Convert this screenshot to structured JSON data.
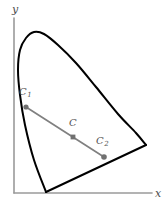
{
  "figure": {
    "background_color": "#ffffff"
  },
  "axes": {
    "x_label": "x",
    "y_label": "y",
    "axis_color": "#9a9a9a",
    "origin_px": [
      14,
      193
    ],
    "x_axis_end_px": [
      152,
      193
    ],
    "y_axis_end_px": [
      14,
      18
    ]
  },
  "labels": {
    "c1_main": "C",
    "c1_sub": "1",
    "c_main": "C",
    "c2_main": "C",
    "c2_sub": "2"
  },
  "chart_data": {
    "type": "line",
    "xlabel": "x",
    "ylabel": "y",
    "grid": false,
    "legend": null,
    "curve_color": "#000000",
    "segment_color": "#808080",
    "point_color": "#707070",
    "series": [
      {
        "name": "spectral-locus",
        "kind": "closed-boundary",
        "description": "Horseshoe-shaped spectral locus closed by straight purple line",
        "points_px": [
          [
            46,
            192
          ],
          [
            34,
            160
          ],
          [
            25,
            125
          ],
          [
            20,
            95
          ],
          [
            18,
            70
          ],
          [
            20,
            50
          ],
          [
            26,
            38
          ],
          [
            34,
            32
          ],
          [
            44,
            34
          ],
          [
            58,
            45
          ],
          [
            76,
            63
          ],
          [
            96,
            87
          ],
          [
            118,
            114
          ],
          [
            136,
            133
          ],
          [
            146,
            145
          ]
        ]
      },
      {
        "name": "purple-line",
        "kind": "straight-closure",
        "points_px": [
          [
            146,
            145
          ],
          [
            46,
            192
          ]
        ]
      },
      {
        "name": "mixture-line",
        "kind": "segment",
        "points_px": [
          [
            26,
            107
          ],
          [
            104,
            157
          ]
        ]
      }
    ],
    "annotations": [
      {
        "label": "C1",
        "text": "C₁",
        "point_px": [
          26,
          107
        ],
        "label_px": [
          19,
          87
        ]
      },
      {
        "label": "C",
        "text": "C",
        "point_px": [
          73,
          137
        ],
        "label_px": [
          69,
          118
        ]
      },
      {
        "label": "C2",
        "text": "C₂",
        "point_px": [
          104,
          157
        ],
        "label_px": [
          96,
          136
        ]
      }
    ]
  }
}
